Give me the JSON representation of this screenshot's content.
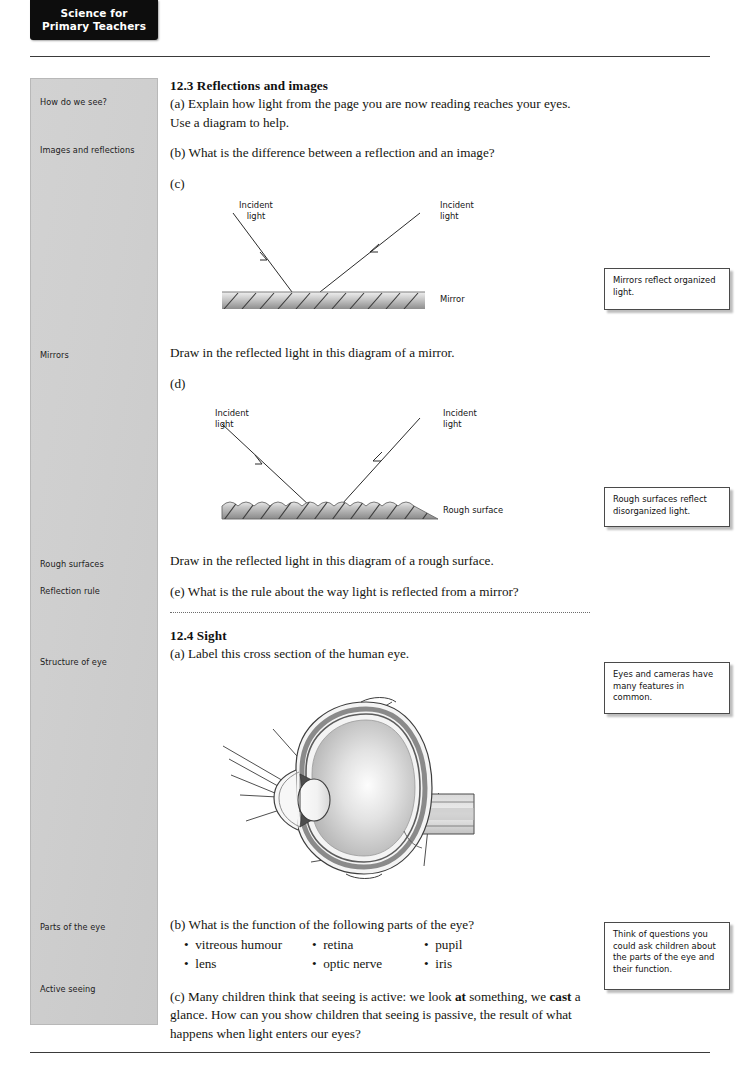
{
  "header": {
    "tab_line1": "Science for",
    "tab_line2": "Primary Teachers"
  },
  "sidebar": {
    "items": [
      {
        "label": "How do we see?",
        "top": 18
      },
      {
        "label": "Images and reflections",
        "top": 66
      },
      {
        "label": "Mirrors",
        "top": 271
      },
      {
        "label": "Rough surfaces",
        "top": 480
      },
      {
        "label": "Reflection rule",
        "top": 507
      },
      {
        "label": "Structure of eye",
        "top": 578
      },
      {
        "label": "Parts of the eye",
        "top": 843
      },
      {
        "label": "Active seeing",
        "top": 905
      }
    ]
  },
  "main": {
    "section_123": {
      "heading": "12.3 Reflections and images",
      "item_a": "(a) Explain how light from the page you are now reading reaches your eyes. Use a diagram to help.",
      "item_b": "(b) What is the difference between a reflection and an image?",
      "item_c_marker": "(c)",
      "mirror_caption": "Draw in the reflected light in this diagram of a mirror.",
      "item_d_marker": "(d)",
      "rough_caption": "Draw in the reflected light in this diagram of a rough surface.",
      "item_e": "(e) What is the rule about the way light is reflected from a mirror?"
    },
    "section_124": {
      "heading": "12.4 Sight",
      "item_a": "(a) Label this cross section of the human eye.",
      "item_b": "(b) What is the function of the following parts of the eye?",
      "parts_list": [
        [
          "vitreous humour",
          "retina",
          "pupil"
        ],
        [
          "lens",
          "optic nerve",
          "iris"
        ]
      ],
      "item_c_pre": "(c) Many children think that seeing is active: we look ",
      "item_c_bold1": "at",
      "item_c_mid": " something, we ",
      "item_c_bold2": "cast",
      "item_c_post": " a glance. How can you show children that seeing is passive, the result of what happens when light enters our eyes?"
    }
  },
  "diagrams": {
    "mirror": {
      "incident_left_l1": "Incident",
      "incident_left_l2": "light",
      "incident_right_l1": "Incident",
      "incident_right_l2": "light",
      "surface_label": "Mirror"
    },
    "rough": {
      "incident_left_l1": "Incident",
      "incident_left_l2": "light",
      "incident_right_l1": "Incident",
      "incident_right_l2": "light",
      "surface_label": "Rough surface"
    },
    "eye": {
      "alt": "unlabelled cross-section of the human eye with blank leader lines"
    }
  },
  "notes": [
    {
      "text": "Mirrors reflect organized light."
    },
    {
      "text": "Rough surfaces reflect disorganized light."
    },
    {
      "text": "Eyes and cameras have many features in common."
    },
    {
      "text": "Think of questions you could ask children about the parts of the eye and their function."
    }
  ]
}
